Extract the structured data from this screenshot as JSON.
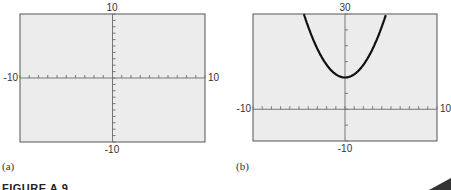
{
  "figure": {
    "caption": "FIGURE A.9",
    "panels": [
      {
        "label": "(a)",
        "xmin": "-10",
        "xmax": "10",
        "ymin": "-10",
        "ymax": "10"
      },
      {
        "label": "(b)",
        "xmin": "-10",
        "xmax": "10",
        "ymin": "-10",
        "ymax": "30"
      }
    ]
  },
  "colors": {
    "plot_background": "#ececec",
    "frame": "#555555",
    "axis": "#777777",
    "curve": "#111111"
  },
  "chart_data": [
    {
      "type": "line",
      "title": "(a)",
      "xlabel": "",
      "ylabel": "",
      "xlim": [
        -10,
        10
      ],
      "ylim": [
        -10,
        10
      ],
      "x_tick_step": 1,
      "y_tick_step": 1,
      "grid": false,
      "series": []
    },
    {
      "type": "line",
      "title": "(b)",
      "xlabel": "",
      "ylabel": "",
      "xlim": [
        -10,
        10
      ],
      "ylim": [
        -10,
        30
      ],
      "x_tick_step": 1,
      "y_tick_step": 5,
      "grid": false,
      "series": [
        {
          "name": "y = x^2 + 10",
          "x": [
            -4.47,
            -4,
            -3,
            -2,
            -1,
            0,
            1,
            2,
            3,
            4,
            4.47
          ],
          "y": [
            30,
            26,
            19,
            14,
            11,
            10,
            11,
            14,
            19,
            26,
            30
          ]
        }
      ]
    }
  ]
}
